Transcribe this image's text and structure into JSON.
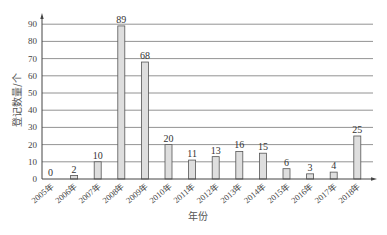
{
  "chart_data": {
    "type": "bar",
    "title": "",
    "xlabel": "年份",
    "ylabel": "登记数量/个",
    "ylim": [
      0,
      90
    ],
    "yticks": [
      0,
      10,
      20,
      30,
      40,
      50,
      60,
      70,
      80,
      90
    ],
    "grid": true,
    "legend": null,
    "categories": [
      "2005年",
      "2006年",
      "2007年",
      "2008年",
      "2009年",
      "2010年",
      "2011年",
      "2012年",
      "2013年",
      "2014年",
      "2015年",
      "2016年",
      "2017年",
      "2018年"
    ],
    "values": [
      0,
      2,
      10,
      89,
      68,
      20,
      11,
      13,
      16,
      15,
      6,
      3,
      4,
      25
    ],
    "bar_color": "#dedede",
    "bar_edge_color": "#555555"
  }
}
